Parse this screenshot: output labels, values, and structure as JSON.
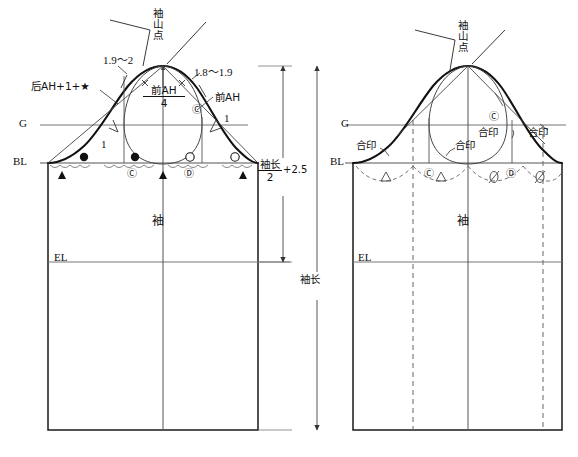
{
  "figure": {
    "type": "sleeve-cap-pattern-draft",
    "colors": {
      "outline": "#1a1a1a",
      "thin": "#555555",
      "guide": "#777777",
      "dashed": "#666666",
      "text": "#111111"
    }
  },
  "left_diagram": {
    "name": "sleeve-draft-construction",
    "labels": {
      "cap_point": "袖山点",
      "back_ah": "后AH+1+★",
      "front_ah": "前AH",
      "front_ah_quarter_num": "前AH",
      "front_ah_quarter_den": "4",
      "dim_left": "1.9～2",
      "dim_right": "1.8～1.9",
      "tick_left": "1",
      "tick_right": "1",
      "g_line": "G",
      "bl_line": "BL",
      "el_line": "EL",
      "sleeve": "袖"
    },
    "ease_marks": {
      "filled_circle": "●",
      "open_circle": "○",
      "filled_triangle": "▲",
      "notch_c": "Ⓒ",
      "notch_d": "Ⓓ"
    }
  },
  "right_diagram": {
    "name": "sleeve-notch-placement",
    "labels": {
      "cap_point": "袖山点",
      "g_line": "G",
      "bl_line": "BL",
      "el_line": "EL",
      "sleeve": "袖",
      "notch_1": "合印",
      "notch_2": "合印",
      "notch_3": "合印",
      "notch_4": "合印",
      "mark_c": "Ⓒ",
      "mark_d": "Ⓓ"
    },
    "ease_marks": {
      "open_triangle": "△",
      "slashed_oval": "∅"
    }
  },
  "dimensions": {
    "half_sleeve_length_num": "袖长",
    "half_sleeve_length_den": "2",
    "half_sleeve_length_suffix": "+2.5",
    "sleeve_length": "袖长"
  }
}
